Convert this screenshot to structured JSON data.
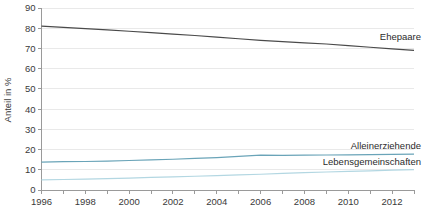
{
  "chart_data": {
    "type": "line",
    "title": "",
    "xlabel": "",
    "ylabel": "Anteil in %",
    "ylim": [
      0,
      90
    ],
    "xlim": [
      1996,
      2013
    ],
    "grid": true,
    "legend_position": "inline-right",
    "ytick_labels": [
      "90",
      "80",
      "70",
      "60",
      "50",
      "40",
      "30",
      "20",
      "10",
      "0"
    ],
    "ytick_values": [
      90,
      80,
      70,
      60,
      50,
      40,
      30,
      20,
      10,
      0
    ],
    "xtick_labels": [
      "1996",
      "1998",
      "2000",
      "2002",
      "2004",
      "2006",
      "2008",
      "2010",
      "2012"
    ],
    "xtick_values": [
      1996,
      1998,
      2000,
      2002,
      2004,
      2006,
      2008,
      2010,
      2012
    ],
    "x": [
      1996,
      1997,
      1998,
      1999,
      2000,
      2001,
      2002,
      2003,
      2004,
      2005,
      2006,
      2007,
      2008,
      2009,
      2010,
      2011,
      2012,
      2013
    ],
    "series": [
      {
        "name": "Ehepaare",
        "color": "#4a4a4a",
        "label_value": "Ehepaare",
        "values": [
          81.0,
          80.4,
          79.8,
          79.2,
          78.5,
          77.8,
          77.1,
          76.4,
          75.6,
          74.8,
          74.0,
          73.4,
          72.8,
          72.2,
          71.4,
          70.6,
          69.8,
          69.0
        ]
      },
      {
        "name": "Alleinerziehende",
        "color": "#6aa4b8",
        "label_value": "Alleinerziehende",
        "values": [
          13.8,
          14.0,
          14.1,
          14.3,
          14.6,
          14.9,
          15.2,
          15.6,
          16.0,
          16.6,
          17.2,
          17.1,
          17.2,
          17.3,
          17.4,
          17.5,
          17.6,
          17.7
        ]
      },
      {
        "name": "Lebensgemeinschaften",
        "color": "#b3d7e2",
        "label_value": "Lebensgemeinschaften",
        "values": [
          5.0,
          5.2,
          5.4,
          5.6,
          5.9,
          6.2,
          6.5,
          6.8,
          7.1,
          7.5,
          7.8,
          8.2,
          8.6,
          8.9,
          9.2,
          9.5,
          9.8,
          10.1
        ]
      }
    ]
  },
  "labels": {
    "ehepaare": "Ehepaare",
    "alleinerziehende": "Alleinerziehende",
    "lebensgemeinschaften": "Lebensgemeinschaften",
    "y_axis_title": "Anteil in %"
  }
}
